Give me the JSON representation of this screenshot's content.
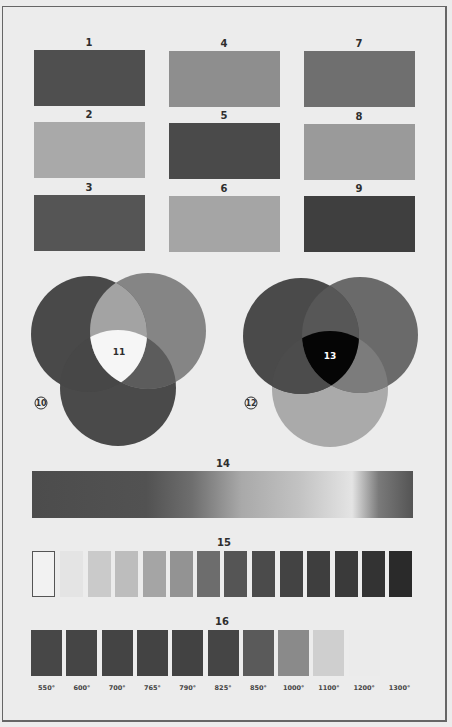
{
  "grid": {
    "blocks": [
      {
        "label": "1",
        "color": "#4f4f4f",
        "x": 34,
        "y": 50
      },
      {
        "label": "2",
        "color": "#a9a9a9",
        "x": 34,
        "y": 122
      },
      {
        "label": "3",
        "color": "#555555",
        "x": 34,
        "y": 195
      },
      {
        "label": "4",
        "color": "#8e8e8e",
        "x": 169,
        "y": 51
      },
      {
        "label": "5",
        "color": "#4a4a4a",
        "x": 169,
        "y": 123
      },
      {
        "label": "6",
        "color": "#a5a5a5",
        "x": 169,
        "y": 196
      },
      {
        "label": "7",
        "color": "#6f6f6f",
        "x": 304,
        "y": 51
      },
      {
        "label": "8",
        "color": "#9a9a9a",
        "x": 304,
        "y": 124
      },
      {
        "label": "9",
        "color": "#3f3f3f",
        "x": 304,
        "y": 196
      }
    ]
  },
  "venn_left": {
    "marker": "10",
    "center_label": "11",
    "circle_colors": {
      "left": "#494949",
      "right": "#858585",
      "bottom": "#4a4a4a"
    },
    "overlap_colors": {
      "left_right": "#a3a3a3",
      "right_bottom": "#5c5c5c",
      "left_bottom": "#474747",
      "all": "#f6f6f6"
    }
  },
  "venn_right": {
    "marker": "12",
    "center_label": "13",
    "circle_colors": {
      "left": "#4a4a4a",
      "right": "#6a6a6a",
      "bottom": "#aaaaaa"
    },
    "overlap_colors": {
      "left_right": "#575757",
      "right_bottom": "#7c7c7c",
      "left_bottom": "#4c4c4c",
      "all": "#050505"
    }
  },
  "gradient_bar": {
    "label": "14",
    "stops": [
      {
        "offset": "0%",
        "color": "#4c4c4c"
      },
      {
        "offset": "30%",
        "color": "#525252"
      },
      {
        "offset": "42%",
        "color": "#6e6e6e"
      },
      {
        "offset": "55%",
        "color": "#a9a9a9"
      },
      {
        "offset": "70%",
        "color": "#c2c2c2"
      },
      {
        "offset": "84%",
        "color": "#e4e4e4"
      },
      {
        "offset": "91%",
        "color": "#7a7a7a"
      },
      {
        "offset": "100%",
        "color": "#545454"
      }
    ]
  },
  "scale_15": {
    "label": "15",
    "swatches": [
      {
        "color": "#f2f2f2",
        "outlined": true
      },
      {
        "color": "#e4e4e4"
      },
      {
        "color": "#cacaca"
      },
      {
        "color": "#bdbdbd"
      },
      {
        "color": "#a5a5a5"
      },
      {
        "color": "#939393"
      },
      {
        "color": "#6d6d6d"
      },
      {
        "color": "#555555"
      },
      {
        "color": "#4b4b4b"
      },
      {
        "color": "#434343"
      },
      {
        "color": "#3e3e3e"
      },
      {
        "color": "#3a3a3a"
      },
      {
        "color": "#333333"
      },
      {
        "color": "#2a2a2a"
      }
    ]
  },
  "scale_16": {
    "label": "16",
    "swatches": [
      {
        "temp": "550°",
        "color": "#474747"
      },
      {
        "temp": "600°",
        "color": "#454545"
      },
      {
        "temp": "700°",
        "color": "#444444"
      },
      {
        "temp": "765°",
        "color": "#434343"
      },
      {
        "temp": "790°",
        "color": "#424242"
      },
      {
        "temp": "825°",
        "color": "#454545"
      },
      {
        "temp": "850°",
        "color": "#5a5a5a"
      },
      {
        "temp": "1000°",
        "color": "#8a8a8a"
      },
      {
        "temp": "1100°",
        "color": "#cfcfcf"
      },
      {
        "temp": "1200°",
        "color": "#ebebeb"
      },
      {
        "temp": "1300°",
        "color": "#ececec"
      }
    ]
  }
}
